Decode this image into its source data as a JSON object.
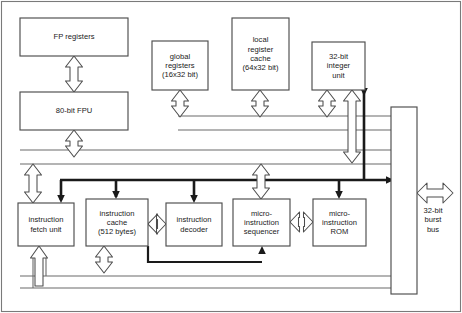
{
  "diagram": {
    "colors": {
      "background": "#ffffff",
      "outline": "#4d4d4d",
      "thin_line": "#6b6b6b",
      "thick_bus": "#1a1a1a",
      "text": "#1a1a1a",
      "arrow_outline": "#4d4d4d"
    },
    "blocks": [
      {
        "id": "fp_registers",
        "label": "FP registers",
        "x": 20,
        "y": 18,
        "w": 108,
        "h": 38
      },
      {
        "id": "fpu",
        "label": "80-bit FPU",
        "x": 20,
        "y": 92,
        "w": 108,
        "h": 38
      },
      {
        "id": "global_registers",
        "label": "global\nregisters\n(16x32 bit)",
        "x": 152,
        "y": 41,
        "w": 56,
        "h": 49
      },
      {
        "id": "local_register_cache",
        "label": "local\nregister\ncache\n(64x32 bit)",
        "x": 232,
        "y": 18,
        "w": 57,
        "h": 72
      },
      {
        "id": "integer_unit",
        "label": "32-bit\ninteger\nunit",
        "x": 312,
        "y": 42,
        "w": 53,
        "h": 48
      },
      {
        "id": "burst_bus_bar",
        "label": "",
        "x": 391,
        "y": 107,
        "w": 26,
        "h": 187
      },
      {
        "id": "instruction_fetch",
        "label": "instruction\nfetch unit",
        "x": 18,
        "y": 203,
        "w": 56,
        "h": 43
      },
      {
        "id": "instruction_cache",
        "label": "instruction\ncache\n(512 bytes)",
        "x": 86,
        "y": 199,
        "w": 62,
        "h": 47
      },
      {
        "id": "instruction_decoder",
        "label": "instruction\ndecoder",
        "x": 166,
        "y": 203,
        "w": 56,
        "h": 43
      },
      {
        "id": "micro_sequencer",
        "label": "micro-\ninstruction\nsequencer",
        "x": 233,
        "y": 199,
        "w": 57,
        "h": 47
      },
      {
        "id": "micro_rom",
        "label": "micro-\ninstruction\nROM",
        "x": 313,
        "y": 199,
        "w": 53,
        "h": 47
      }
    ],
    "bus_labels": [
      {
        "id": "burst_bus_label",
        "label": "32-bit\nburst\nbus",
        "x": 414,
        "y": 206
      }
    ]
  }
}
